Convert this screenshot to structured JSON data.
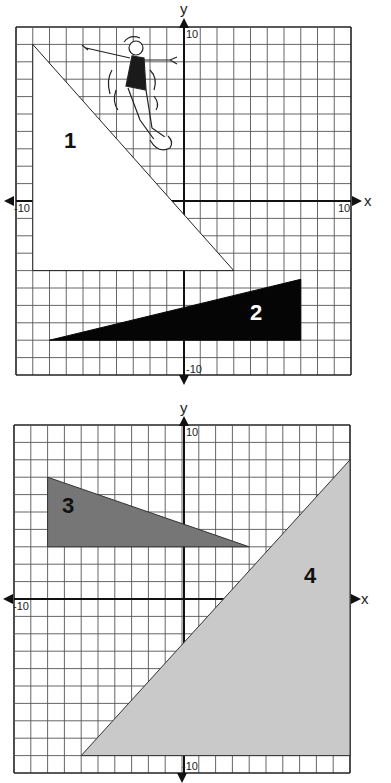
{
  "colors": {
    "grid": "#555555",
    "axis": "#111111",
    "shape1": "#ffffff",
    "shape2": "#050505",
    "shape3": "#767676",
    "shape4": "#c9c9c9"
  },
  "graphs": [
    {
      "axis_x_label": "x",
      "axis_y_label": "y",
      "tick_labels": {
        "x_min": "-10",
        "x_max": "10",
        "y_max": "10",
        "y_min": "-10"
      },
      "shapes": [
        {
          "id": "1",
          "label": "1",
          "fill": "white",
          "vertices": [
            [
              -9,
              9
            ],
            [
              -9,
              -4
            ],
            [
              3,
              -4
            ]
          ]
        },
        {
          "id": "2",
          "label": "2",
          "fill": "black",
          "vertices": [
            [
              -8,
              -8
            ],
            [
              7,
              -8
            ],
            [
              7,
              -4.5
            ]
          ]
        }
      ],
      "illustration": "woman sliding down triangle 1's hypotenuse"
    },
    {
      "axis_x_label": "x",
      "axis_y_label": "y",
      "tick_labels": {
        "x_min": "-10",
        "x_max": "",
        "y_max": "10",
        "y_min": "-10"
      },
      "shapes": [
        {
          "id": "3",
          "label": "3",
          "fill": "dark gray",
          "vertices": [
            [
              -8,
              7
            ],
            [
              -8,
              3
            ],
            [
              4,
              3
            ]
          ]
        },
        {
          "id": "4",
          "label": "4",
          "fill": "light gray",
          "vertices": [
            [
              -6,
              -9
            ],
            [
              10,
              -9
            ],
            [
              10,
              8
            ]
          ]
        }
      ]
    }
  ],
  "chart_data": [
    {
      "type": "scatter",
      "title": "",
      "xlabel": "x",
      "ylabel": "y",
      "xlim": [
        -10,
        10
      ],
      "ylim": [
        -10,
        10
      ],
      "grid": true,
      "tick_labels": [
        "-10",
        "10",
        "10",
        "-10"
      ],
      "series": [
        {
          "name": "Triangle 1",
          "values": [
            [
              -9,
              9
            ],
            [
              -9,
              -4
            ],
            [
              3,
              -4
            ]
          ]
        },
        {
          "name": "Triangle 2",
          "values": [
            [
              -8,
              -8
            ],
            [
              7,
              -8
            ],
            [
              7,
              -4.5
            ]
          ]
        }
      ]
    },
    {
      "type": "scatter",
      "title": "",
      "xlabel": "x",
      "ylabel": "y",
      "xlim": [
        -10,
        10
      ],
      "ylim": [
        -10,
        10
      ],
      "grid": true,
      "tick_labels": [
        "-10",
        "10",
        "-10"
      ],
      "series": [
        {
          "name": "Triangle 3",
          "values": [
            [
              -8,
              7
            ],
            [
              -8,
              3
            ],
            [
              4,
              3
            ]
          ]
        },
        {
          "name": "Triangle 4",
          "values": [
            [
              -6,
              -9
            ],
            [
              10,
              -9
            ],
            [
              10,
              8
            ]
          ]
        }
      ]
    }
  ]
}
